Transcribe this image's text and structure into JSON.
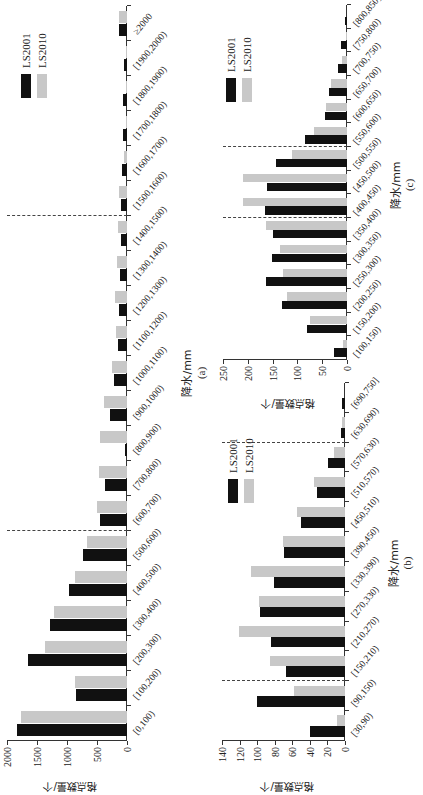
{
  "figure": {
    "captions": [
      "(a)",
      "(b)",
      "(c)"
    ]
  },
  "chart_data": [
    {
      "id": "a",
      "type": "bar",
      "title": "",
      "caption": "(a)",
      "xlabel": "降水/mm",
      "ylabel": "格点数量/个",
      "ylim": [
        0,
        2000
      ],
      "yticks": [
        0,
        500,
        1000,
        1500,
        2000
      ],
      "legend": [
        "LS2001",
        "LS2010"
      ],
      "legend_position": "upper right",
      "grid": false,
      "categories": [
        "[0,100)",
        "[100,200)",
        "[200,300)",
        "[300,400)",
        "[400,500)",
        "[500,600)",
        "[600,700)",
        "[700,800)",
        "[800,900)",
        "[900,1000)",
        "[1000,1100)",
        "[1100,1200)",
        "[1200,1300)",
        "[1300,1400)",
        "[1400,1500)",
        "[1500,1600)",
        "[1600,1700)",
        "[1700,1800)",
        "[1800,1900)",
        "[1900,2000)",
        "≥2000"
      ],
      "series": [
        {
          "name": "LS2001",
          "color": "#111111",
          "values": [
            1835,
            845,
            1650,
            1290,
            960,
            740,
            450,
            370,
            30,
            285,
            215,
            150,
            130,
            110,
            100,
            95,
            80,
            75,
            65,
            50,
            140
          ]
        },
        {
          "name": "LS2010",
          "color": "#c8c8c8",
          "values": [
            1770,
            860,
            1370,
            1220,
            860,
            660,
            500,
            470,
            450,
            380,
            245,
            180,
            200,
            165,
            150,
            140,
            50,
            25,
            20,
            10,
            130
          ]
        }
      ],
      "dashed_lines_after_index": [
        5,
        14
      ]
    },
    {
      "id": "b",
      "type": "bar",
      "title": "",
      "caption": "(b)",
      "xlabel": "降水/mm",
      "ylabel": "格点数量/个",
      "ylim": [
        0,
        140
      ],
      "yticks": [
        0,
        20,
        40,
        60,
        80,
        100,
        120,
        140
      ],
      "legend": [
        "LS2001",
        "LS2010"
      ],
      "legend_position": "upper right",
      "grid": false,
      "categories": [
        "[30,90)",
        "[90,150)",
        "[150,210)",
        "[210,270)",
        "[270,330)",
        "[330,390)",
        "[390,450)",
        "[450,510)",
        "[510,570)",
        "[570,630)",
        "[630,690)",
        "[690,750]"
      ],
      "series": [
        {
          "name": "LS2001",
          "color": "#111111",
          "values": [
            40,
            100,
            67,
            84,
            97,
            81,
            70,
            50,
            32,
            19,
            5,
            4
          ]
        },
        {
          "name": "LS2010",
          "color": "#c8c8c8",
          "values": [
            9,
            58,
            85,
            121,
            98,
            107,
            71,
            55,
            35,
            13,
            3,
            0
          ]
        }
      ],
      "dashed_lines_after_index": [
        1,
        9
      ]
    },
    {
      "id": "c",
      "type": "bar",
      "title": "",
      "caption": "(c)",
      "xlabel": "降水/mm",
      "ylabel": "格点数量/个",
      "ylim": [
        0,
        250
      ],
      "yticks": [
        0,
        50,
        100,
        150,
        200,
        250
      ],
      "legend": [
        "LS2001",
        "LS2010"
      ],
      "legend_position": "upper right",
      "grid": false,
      "categories": [
        "[100,150)",
        "[150,200)",
        "[200,250)",
        "[250,300)",
        "[300,350)",
        "[350,400)",
        "[400,450)",
        "[450,500)",
        "[500,550)",
        "[550,600)",
        "[600,650)",
        "[650,700)",
        "[700,750)",
        "[750,800)",
        "[800,850]"
      ],
      "series": [
        {
          "name": "LS2001",
          "color": "#111111",
          "values": [
            26,
            81,
            132,
            163,
            152,
            150,
            166,
            162,
            143,
            85,
            45,
            37,
            18,
            12,
            4
          ]
        },
        {
          "name": "LS2010",
          "color": "#c8c8c8",
          "values": [
            8,
            75,
            120,
            130,
            136,
            163,
            209,
            209,
            111,
            66,
            42,
            33,
            10,
            3,
            0
          ]
        }
      ],
      "dashed_lines_after_index": [
        5,
        8
      ]
    }
  ]
}
